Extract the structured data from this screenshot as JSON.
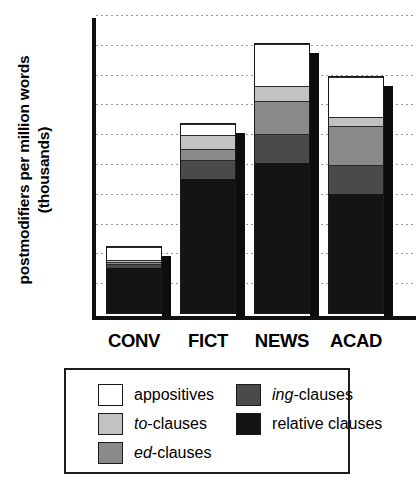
{
  "chart_data": {
    "type": "bar",
    "subtype": "stacked-bar",
    "title": "",
    "xlabel": "",
    "ylabel": "postmodifiers per million words (thousands)",
    "categories": [
      "CONV",
      "FICT",
      "NEWS",
      "ACAD"
    ],
    "ylim": [
      0,
      25
    ],
    "yticks": [
      0,
      5,
      10,
      15,
      20,
      25
    ],
    "ytick_labels": [
      "0",
      "5",
      "10",
      "15",
      "20",
      "25"
    ],
    "gridlines": [
      2.5,
      5,
      7.5,
      10,
      12.5,
      15,
      17.5,
      20,
      22.5,
      25
    ],
    "grid": true,
    "legend_position": "below-plot",
    "stack_order_bottom_to_top": [
      "relative clauses",
      "ing-clauses",
      "ed-clauses",
      "to-clauses",
      "appositives"
    ],
    "series": [
      {
        "name": "relative clauses",
        "color": "#141414",
        "values": [
          3.9,
          11.4,
          12.7,
          10.1
        ]
      },
      {
        "name": "ing-clauses",
        "color": "#4a4a4a",
        "values": [
          0.3,
          1.6,
          2.4,
          2.4
        ]
      },
      {
        "name": "ed-clauses",
        "color": "#8a8a8a",
        "values": [
          0.2,
          0.9,
          2.8,
          3.3
        ]
      },
      {
        "name": "to-clauses",
        "color": "#c2c2c2",
        "values": [
          0.2,
          1.2,
          1.3,
          0.8
        ]
      },
      {
        "name": "appositives",
        "color": "#ffffff",
        "values": [
          1.1,
          0.9,
          3.5,
          3.4
        ]
      }
    ],
    "totals": [
      5.7,
      16.0,
      22.7,
      20.0
    ]
  },
  "legend": {
    "entries": [
      {
        "label": "appositives",
        "label_italic_prefix": "",
        "color": "#ffffff"
      },
      {
        "label": "to-clauses",
        "label_italic_prefix": "to",
        "color": "#c2c2c2"
      },
      {
        "label": "ed-clauses",
        "label_italic_prefix": "ed",
        "color": "#8a8a8a"
      },
      {
        "label": "ing-clauses",
        "label_italic_prefix": "ing",
        "color": "#4a4a4a"
      },
      {
        "label": "relative clauses",
        "label_italic_prefix": "",
        "color": "#141414"
      }
    ]
  }
}
